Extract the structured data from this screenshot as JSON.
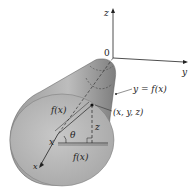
{
  "diagram": {
    "type": "solid-of-revolution",
    "axes": {
      "z_label": "z",
      "y_label": "y",
      "x_label": "x",
      "origin_label": "0"
    },
    "labels": {
      "curve": "y = f(x)",
      "point": "(x, y, z)",
      "radius_upper": "f(x)",
      "radius_lower": "f(x)",
      "angle": "θ",
      "height": "z",
      "x_on_axis": "x"
    },
    "colors": {
      "solid_fill_light": "#c9c9c9",
      "solid_fill_dark": "#8a8a8a",
      "face_fill": "#bdbdbd",
      "line": "#222222",
      "background": "#ffffff"
    }
  }
}
